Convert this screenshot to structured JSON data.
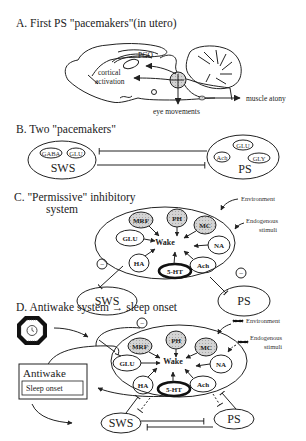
{
  "panels": {
    "a": {
      "title": "A. First PS \"pacemakers\"(in utero)",
      "labels": {
        "pgo": "PGO",
        "cortical_1": "cortical",
        "cortical_2": "activation",
        "eye": "eye movements",
        "muscle": "muscle atony"
      }
    },
    "b": {
      "title": "B. Two \"pacemakers\"",
      "sws": {
        "label": "SWS",
        "nodes": [
          "GABA",
          "GLU"
        ]
      },
      "ps": {
        "label": "PS",
        "nodes": [
          "GLU",
          "Ach",
          "GLY"
        ]
      }
    },
    "c": {
      "title_1": "C.  \"Permissive\" inhibitory",
      "title_2": "system",
      "center": "Wake",
      "nodes": [
        "MRF",
        "PH",
        "MC",
        "GLU",
        "NA",
        "HA",
        "5-HT",
        "Ach"
      ],
      "environment": "Environment",
      "endogenous_1": "Endogenous",
      "endogenous_2": "stimuli",
      "minus": "−",
      "sws": "SWS",
      "ps": "PS"
    },
    "d": {
      "title": "D.  Antiwake system → sleep onset",
      "center": "Wake",
      "nodes": [
        "MRF",
        "PH",
        "MC",
        "GLU",
        "NA",
        "HA",
        "5-HT",
        "Ach"
      ],
      "environment": "Environment",
      "endogenous_1": "Endogenous",
      "endogenous_2": "stimuli",
      "antiwake": "Antiwake",
      "sleep_onset": "Sleep onset",
      "minus": "−",
      "sws": "SWS",
      "ps": "PS",
      "icons": [
        "clock-icon",
        "dna-icon"
      ]
    }
  }
}
